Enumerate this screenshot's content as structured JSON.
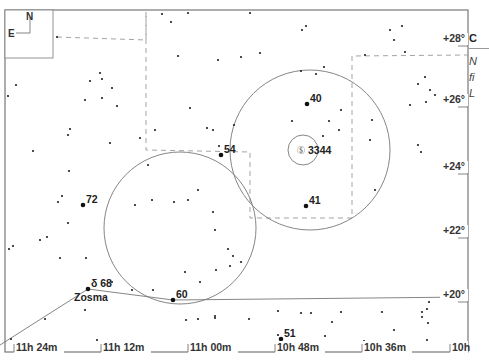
{
  "chart_data": {
    "type": "scatter",
    "xlabel": "Right Ascension",
    "ylabel": "Declination",
    "x_ticks": [
      "11h 24m",
      "11h 12m",
      "11h 00m",
      "10h 48m",
      "10h 36m",
      "10h"
    ],
    "y_ticks": [
      "+28°",
      "+26°",
      "+24°",
      "+22°",
      "+20°"
    ],
    "grid": false,
    "legend": null,
    "compass": {
      "north": "N",
      "east": "E"
    },
    "labeled_objects": [
      {
        "label": "40",
        "type": "star",
        "x": 307,
        "y": 104
      },
      {
        "label": "3344",
        "type": "galaxy",
        "symbol": "Ⓢ",
        "x": 303,
        "y": 150
      },
      {
        "label": "54",
        "type": "star",
        "x": 221,
        "y": 155
      },
      {
        "label": "41",
        "type": "star",
        "x": 306,
        "y": 206
      },
      {
        "label": "72",
        "type": "star",
        "x": 83,
        "y": 205
      },
      {
        "label": "δ 68",
        "name": "Zosma",
        "type": "star",
        "x": 88,
        "y": 289
      },
      {
        "label": "60",
        "type": "star",
        "x": 173,
        "y": 300
      },
      {
        "label": "51",
        "type": "star",
        "x": 281,
        "y": 339
      }
    ],
    "circles": [
      {
        "cx": 310,
        "cy": 150,
        "r": 80
      },
      {
        "cx": 180,
        "cy": 228,
        "r": 76
      },
      {
        "cx": 303,
        "cy": 150,
        "r": 15
      }
    ],
    "stars": [
      [
        57,
        37
      ],
      [
        8,
        96
      ],
      [
        100,
        73
      ],
      [
        90,
        81
      ],
      [
        102,
        79
      ],
      [
        112,
        88
      ],
      [
        102,
        98
      ],
      [
        85,
        100
      ],
      [
        117,
        106
      ],
      [
        16,
        85
      ],
      [
        162,
        14
      ],
      [
        171,
        22
      ],
      [
        188,
        13
      ],
      [
        250,
        13
      ],
      [
        302,
        30
      ],
      [
        306,
        26
      ],
      [
        178,
        56
      ],
      [
        218,
        60
      ],
      [
        241,
        57
      ],
      [
        260,
        53
      ],
      [
        301,
        71
      ],
      [
        316,
        74
      ],
      [
        324,
        67
      ],
      [
        365,
        55
      ],
      [
        390,
        30
      ],
      [
        402,
        26
      ],
      [
        394,
        40
      ],
      [
        405,
        52
      ],
      [
        418,
        84
      ],
      [
        70,
        129
      ],
      [
        68,
        135
      ],
      [
        33,
        151
      ],
      [
        69,
        171
      ],
      [
        62,
        196
      ],
      [
        58,
        202
      ],
      [
        68,
        223
      ],
      [
        47,
        237
      ],
      [
        40,
        240
      ],
      [
        13,
        246
      ],
      [
        9,
        249
      ],
      [
        140,
        138
      ],
      [
        148,
        165
      ],
      [
        135,
        205
      ],
      [
        174,
        202
      ],
      [
        213,
        212
      ],
      [
        219,
        146
      ],
      [
        234,
        125
      ],
      [
        292,
        121
      ],
      [
        341,
        110
      ],
      [
        329,
        121
      ],
      [
        323,
        136
      ],
      [
        339,
        130
      ],
      [
        370,
        140
      ],
      [
        372,
        120
      ],
      [
        375,
        190
      ],
      [
        425,
        77
      ],
      [
        430,
        90
      ],
      [
        426,
        102
      ],
      [
        435,
        95
      ],
      [
        421,
        152
      ],
      [
        443,
        172
      ],
      [
        410,
        105
      ],
      [
        418,
        145
      ],
      [
        213,
        130
      ],
      [
        207,
        128
      ],
      [
        190,
        108
      ],
      [
        155,
        130
      ],
      [
        110,
        143
      ],
      [
        152,
        200
      ],
      [
        188,
        200
      ],
      [
        198,
        190
      ],
      [
        215,
        230
      ],
      [
        228,
        249
      ],
      [
        233,
        256
      ],
      [
        230,
        266
      ],
      [
        241,
        262
      ],
      [
        216,
        270
      ],
      [
        185,
        272
      ],
      [
        200,
        282
      ],
      [
        153,
        290
      ],
      [
        132,
        290
      ],
      [
        112,
        282
      ],
      [
        86,
        258
      ],
      [
        60,
        258
      ],
      [
        215,
        316
      ],
      [
        301,
        313
      ],
      [
        341,
        312
      ],
      [
        382,
        312
      ],
      [
        422,
        312
      ],
      [
        427,
        309
      ],
      [
        429,
        302
      ],
      [
        428,
        323
      ],
      [
        422,
        317
      ],
      [
        427,
        340
      ],
      [
        364,
        341
      ],
      [
        394,
        330
      ],
      [
        332,
        322
      ],
      [
        325,
        336
      ],
      [
        278,
        335
      ],
      [
        85,
        310
      ],
      [
        97,
        340
      ],
      [
        45,
        319
      ],
      [
        11,
        339
      ],
      [
        186,
        320
      ],
      [
        198,
        319
      ],
      [
        215,
        318
      ],
      [
        249,
        319
      ],
      [
        278,
        311
      ],
      [
        311,
        313
      ]
    ],
    "constellation_lines": [
      {
        "from": [
          88,
          289
        ],
        "to": [
          0,
          345
        ]
      },
      {
        "from": [
          88,
          289
        ],
        "to": [
          173,
          300
        ]
      },
      {
        "from": [
          173,
          300
        ],
        "to": [
          468,
          297
        ]
      }
    ],
    "boundary_dashed": [
      [
        [
          57,
          37
        ],
        [
          146,
          40
        ],
        [
          146,
          12
        ]
      ],
      [
        [
          146,
          12
        ],
        [
          146,
          150
        ],
        [
          250,
          152
        ],
        [
          250,
          218
        ],
        [
          352,
          218
        ],
        [
          352,
          56
        ],
        [
          468,
          55
        ]
      ]
    ]
  },
  "side_panel": {
    "title": "C",
    "lines": [
      "N",
      "fi",
      "L"
    ]
  }
}
